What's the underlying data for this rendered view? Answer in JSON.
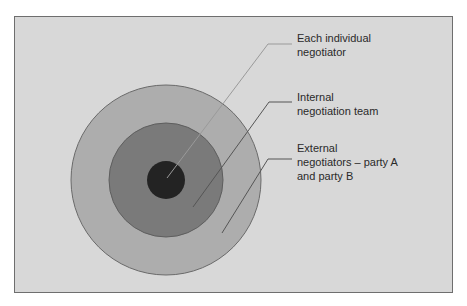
{
  "diagram": {
    "type": "concentric-circles",
    "colors": {
      "background": "#d8d8d8",
      "outer_circle": "#adadad",
      "middle_circle": "#7a7a7a",
      "inner_circle": "#232323",
      "leader_line": "#555555",
      "text": "#2a2a2a"
    },
    "layers": [
      {
        "id": "inner",
        "label_lines": [
          "Each individual",
          "negotiator"
        ]
      },
      {
        "id": "middle",
        "label_lines": [
          "Internal",
          "negotiation team"
        ]
      },
      {
        "id": "outer",
        "label_lines": [
          "External",
          "negotiators – party A",
          "and party B"
        ]
      }
    ]
  }
}
